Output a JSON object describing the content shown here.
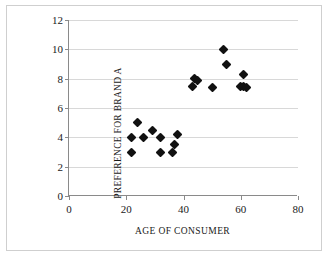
{
  "chart_data": {
    "type": "scatter",
    "title": "",
    "xlabel": "AGE OF CONSUMER",
    "ylabel": "PREFERENCE FOR BRAND A",
    "xlim": [
      0,
      80
    ],
    "ylim": [
      0,
      12
    ],
    "xticks": [
      0,
      20,
      40,
      60,
      80
    ],
    "yticks": [
      0,
      2,
      4,
      6,
      8,
      10,
      12
    ],
    "grid": "horizontal",
    "legend": "none",
    "marker": "diamond",
    "marker_color": "#111111",
    "points": [
      {
        "x": 22,
        "y": 4
      },
      {
        "x": 22,
        "y": 3
      },
      {
        "x": 24,
        "y": 5
      },
      {
        "x": 26,
        "y": 4
      },
      {
        "x": 29,
        "y": 4.5
      },
      {
        "x": 32,
        "y": 4
      },
      {
        "x": 32,
        "y": 3
      },
      {
        "x": 36,
        "y": 3
      },
      {
        "x": 37,
        "y": 3.5
      },
      {
        "x": 38,
        "y": 4.2
      },
      {
        "x": 43,
        "y": 7.5
      },
      {
        "x": 44,
        "y": 8
      },
      {
        "x": 45,
        "y": 7.9
      },
      {
        "x": 50,
        "y": 7.4
      },
      {
        "x": 54,
        "y": 10
      },
      {
        "x": 55,
        "y": 9
      },
      {
        "x": 60,
        "y": 7.5
      },
      {
        "x": 61,
        "y": 8.3
      },
      {
        "x": 61,
        "y": 7.5
      },
      {
        "x": 62,
        "y": 7.4
      }
    ]
  }
}
